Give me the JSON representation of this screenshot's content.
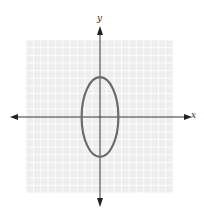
{
  "chart_data": {
    "type": "line",
    "title": "",
    "xlabel": "x",
    "ylabel": "y",
    "grid": true,
    "legend": null,
    "xlim": [
      -10,
      10
    ],
    "ylim": [
      -10,
      10
    ],
    "curve": {
      "shape": "ellipse",
      "center": [
        0,
        0
      ],
      "semi_axis_x": 2.5,
      "semi_axis_y": 5.2
    },
    "colors": {
      "grid_fill": "#eeeeee",
      "grid_line": "#ffffff",
      "axis": "#333333",
      "curve": "#6b6b6b"
    }
  }
}
